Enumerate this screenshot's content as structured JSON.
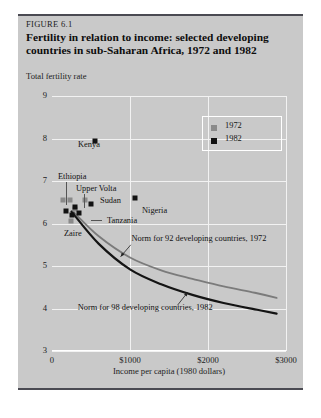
{
  "figure": {
    "number": "FIGURE 6.1",
    "title": "Fertility in relation to income: selected developing countries in sub-Saharan Africa, 1972 and 1982"
  },
  "legend": {
    "position": "top-right",
    "items": [
      {
        "label": "1972",
        "color": "#8a8a8a"
      },
      {
        "label": "1982",
        "color": "#121212"
      }
    ]
  },
  "chart_data": {
    "type": "scatter",
    "title": "Fertility in relation to income: selected developing countries in sub-Saharan Africa, 1972 and 1982",
    "xlabel": "Income per capita (1980 dollars)",
    "ylabel": "Total fertility rate",
    "xlim": [
      0,
      3000
    ],
    "ylim": [
      3,
      9
    ],
    "xticks": [
      0,
      1000,
      2000,
      3000
    ],
    "xticklabels": [
      "0",
      "$1000",
      "$2000",
      "$3000"
    ],
    "yticks": [
      3,
      4,
      5,
      6,
      7,
      8,
      9
    ],
    "yticklabels": [
      "3",
      "4",
      "5",
      "6",
      "7",
      "8",
      "9"
    ],
    "grid": true,
    "legend_entries": [
      "1972",
      "1982"
    ],
    "series": [
      {
        "name": "1972",
        "color": "#8a8a8a",
        "points": [
          {
            "label": "Ethiopia",
            "x": 140,
            "y": 6.55
          },
          {
            "label": "Upper Volta",
            "x": 230,
            "y": 6.55
          },
          {
            "label": "Sudan",
            "x": 420,
            "y": 6.55
          },
          {
            "label": "Zaire",
            "x": 245,
            "y": 6.05
          },
          {
            "label": "Tanzania",
            "x": 300,
            "y": 6.35
          }
        ]
      },
      {
        "name": "1982",
        "color": "#121212",
        "points": [
          {
            "label": "Kenya",
            "x": 545,
            "y": 7.95
          },
          {
            "label": "Nigeria",
            "x": 1065,
            "y": 6.6
          },
          {
            "label": "Sudan",
            "x": 500,
            "y": 6.45
          },
          {
            "label": "Upper Volta",
            "x": 300,
            "y": 6.4
          },
          {
            "label": "Ethiopia",
            "x": 185,
            "y": 6.3
          },
          {
            "label": "Zaire",
            "x": 255,
            "y": 6.2
          },
          {
            "label": "Tanzania",
            "x": 350,
            "y": 6.25
          }
        ]
      }
    ],
    "curves": [
      {
        "name": "Norm for 92 developing countries, 1972",
        "color": "#7b7b7b",
        "points": [
          {
            "x": 260,
            "y": 6.3
          },
          {
            "x": 600,
            "y": 5.7
          },
          {
            "x": 1000,
            "y": 5.2
          },
          {
            "x": 1400,
            "y": 4.9
          },
          {
            "x": 1800,
            "y": 4.7
          },
          {
            "x": 2200,
            "y": 4.52
          },
          {
            "x": 2600,
            "y": 4.37
          },
          {
            "x": 2880,
            "y": 4.25
          }
        ]
      },
      {
        "name": "Norm for 98 developing countries, 1982",
        "color": "#141414",
        "points": [
          {
            "x": 250,
            "y": 6.28
          },
          {
            "x": 600,
            "y": 5.52
          },
          {
            "x": 1000,
            "y": 4.92
          },
          {
            "x": 1400,
            "y": 4.57
          },
          {
            "x": 1800,
            "y": 4.32
          },
          {
            "x": 2200,
            "y": 4.13
          },
          {
            "x": 2600,
            "y": 3.98
          },
          {
            "x": 2880,
            "y": 3.88
          }
        ]
      }
    ],
    "annotations": [
      {
        "text": "Norm for 92 developing countries, 1972",
        "x": 1020,
        "y": 5.62
      },
      {
        "text": "Norm for 98 developing countries, 1982",
        "x": 330,
        "y": 4.0
      }
    ],
    "point_labels": [
      "Kenya",
      "Ethiopia",
      "Upper Volta",
      "Sudan",
      "Nigeria",
      "Tanzania",
      "Zaire"
    ]
  }
}
